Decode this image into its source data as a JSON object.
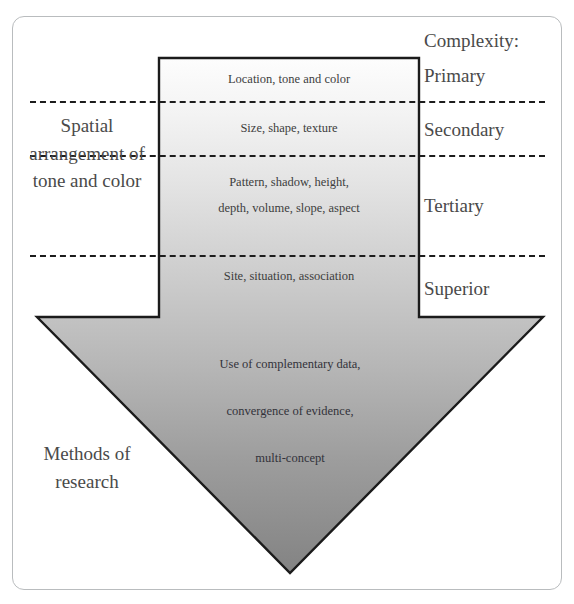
{
  "diagram": {
    "type": "annotated-arrow-diagram"
  },
  "complexity": {
    "heading": "Complexity:",
    "levels": [
      {
        "label": "Primary",
        "content": "Location, tone and color"
      },
      {
        "label": "Secondary",
        "content": "Size, shape, texture"
      },
      {
        "label": "Tertiary",
        "content_line1": "Pattern, shadow, height,",
        "content_line2": "depth, volume, slope, aspect"
      },
      {
        "label": "Superior",
        "content": "Site, situation, association"
      }
    ]
  },
  "left_captions": {
    "spatial": "Spatial arrangement of tone and color",
    "methods": "Methods of research"
  },
  "arrowhead": {
    "lines": [
      "Use of complementary data,",
      "convergence of evidence,",
      "multi-concept"
    ]
  },
  "colors": {
    "frame_border": "#b9bcbe",
    "shape_outline": "#1b1b1b",
    "dash_line": "#1c1c1c",
    "gradient_top": "#fdfdfd",
    "gradient_bottom": "#838383",
    "text": "#3a3a3a"
  }
}
